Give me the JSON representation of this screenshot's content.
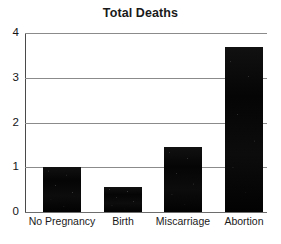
{
  "chart_data": {
    "type": "bar",
    "title": "Total Deaths",
    "xlabel": "",
    "ylabel": "",
    "categories": [
      "No Pregnancy",
      "Birth",
      "Miscarriage",
      "Abortion"
    ],
    "values": [
      1.0,
      0.55,
      1.45,
      3.68
    ],
    "ylim": [
      0,
      4
    ],
    "yticks": [
      "0",
      "1",
      "2",
      "3",
      "4"
    ],
    "ytick_values": [
      0,
      1,
      2,
      3,
      4
    ],
    "grid": true,
    "legend": false,
    "bar_color": "#000000",
    "grid_color": "#8b8b8b",
    "axis_color": "#4a4a4a",
    "text_color": "#1a1a1a"
  }
}
